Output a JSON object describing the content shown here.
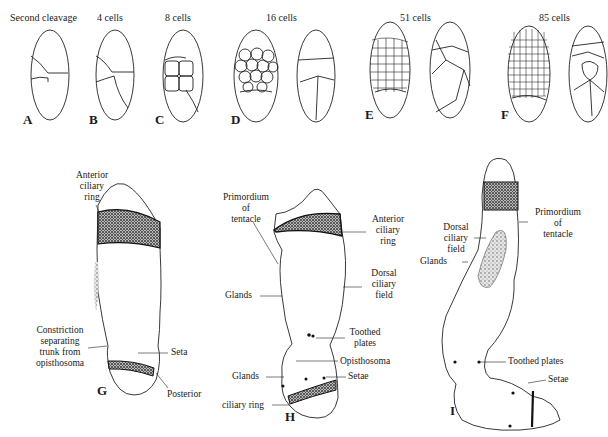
{
  "figure": {
    "top_row": {
      "stages": [
        {
          "panel": "A",
          "title": "Second cleavage"
        },
        {
          "panel": "B",
          "title": "4 cells"
        },
        {
          "panel": "C",
          "title": "8 cells"
        },
        {
          "panel": "D",
          "title": "16 cells"
        },
        {
          "panel": "E",
          "title": "51 cells"
        },
        {
          "panel": "F",
          "title": "85 cells"
        }
      ]
    },
    "larvae": {
      "G": {
        "panel": "G",
        "labels": {
          "anterior_ciliary_ring": [
            "Anterior",
            "ciliary",
            "ring"
          ],
          "constriction": [
            "Constriction",
            "separating",
            "trunk from",
            "opisthosoma"
          ],
          "seta": "Seta",
          "posterior": "Posterior"
        }
      },
      "H": {
        "panel": "H",
        "labels": {
          "primordium": [
            "Primordium",
            "of",
            "tentacle"
          ],
          "anterior_ciliary_ring": [
            "Anterior",
            "ciliary",
            "ring"
          ],
          "dorsal_ciliary_field": [
            "Dorsal",
            "ciliary",
            "field"
          ],
          "glands_upper": "Glands",
          "toothed_plates": [
            "Toothed",
            "plates"
          ],
          "opisthosoma": "Opisthosoma",
          "glands_lower": "Glands",
          "setae": "Setae",
          "ciliary_ring": "ciliary ring"
        }
      },
      "I": {
        "panel": "I",
        "labels": {
          "primordium": [
            "Primordium",
            "of",
            "tentacle"
          ],
          "dorsal_ciliary_field": [
            "Dorsal",
            "ciliary",
            "field"
          ],
          "glands": "Glands",
          "toothed_plates": "Toothed plates",
          "setae": "Setae"
        }
      }
    }
  }
}
